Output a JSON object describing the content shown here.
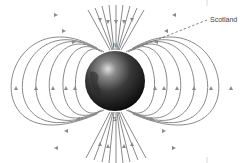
{
  "diagram": {
    "labels": {
      "north_pole": "N",
      "south_pole": "S",
      "callout": "Scotland"
    },
    "globe": {
      "center": [
        115,
        81
      ],
      "radius": 30,
      "colors": {
        "highlight": "#d9d9d9",
        "mid": "#4a4a4a",
        "shadow": "#0d0d0d"
      }
    },
    "field_lines": {
      "color": "#8a8a8a",
      "loop_half_widths": [
        35,
        45,
        58,
        78,
        98,
        117
      ],
      "arrow_direction": "out of S pole, around sides, into N pole"
    },
    "colors": {
      "background": "#ffffff",
      "text": "#444444",
      "callout_line": "#666666"
    }
  }
}
